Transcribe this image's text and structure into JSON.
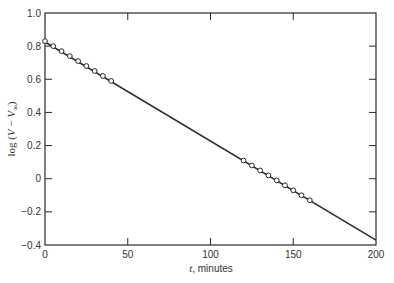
{
  "chart_data": {
    "type": "scatter",
    "title": "",
    "xlabel": "t, minutes",
    "xlabel_var": "t",
    "xlabel_unit": ", minutes",
    "ylabel": "log (V − V∞)",
    "ylabel_parts": {
      "prefix": "log (",
      "v1": "V",
      "minus": " − ",
      "v2": "V",
      "sub": "∞",
      "suffix": ")"
    },
    "xlim": [
      0,
      200
    ],
    "ylim": [
      -0.4,
      1.0
    ],
    "xticks": [
      0,
      50,
      100,
      150,
      200
    ],
    "xtick_labels": [
      "0",
      "50",
      "100",
      "150",
      "200"
    ],
    "yticks": [
      1.0,
      0.8,
      0.6,
      0.4,
      0.2,
      0,
      -0.2,
      -0.4
    ],
    "ytick_labels": [
      "1.0",
      "0.8",
      "0.6",
      "0.4",
      "0.2",
      "0",
      "−0.2",
      "−0.4"
    ],
    "grid": false,
    "legend": null,
    "series": [
      {
        "name": "measured",
        "marker": "open-circle",
        "x": [
          0,
          5,
          10,
          15,
          20,
          25,
          30,
          35,
          40,
          120,
          125,
          130,
          135,
          140,
          145,
          150,
          155,
          160
        ],
        "y": [
          0.83,
          0.8,
          0.77,
          0.74,
          0.71,
          0.68,
          0.65,
          0.62,
          0.59,
          0.11,
          0.08,
          0.05,
          0.02,
          -0.01,
          -0.04,
          -0.07,
          -0.1,
          -0.13
        ]
      },
      {
        "name": "fit",
        "style": "line",
        "x": [
          0,
          200
        ],
        "y": [
          0.825,
          -0.37
        ]
      }
    ],
    "colors": {
      "ink": "#2a2a2a",
      "background": "#ffffff"
    }
  }
}
